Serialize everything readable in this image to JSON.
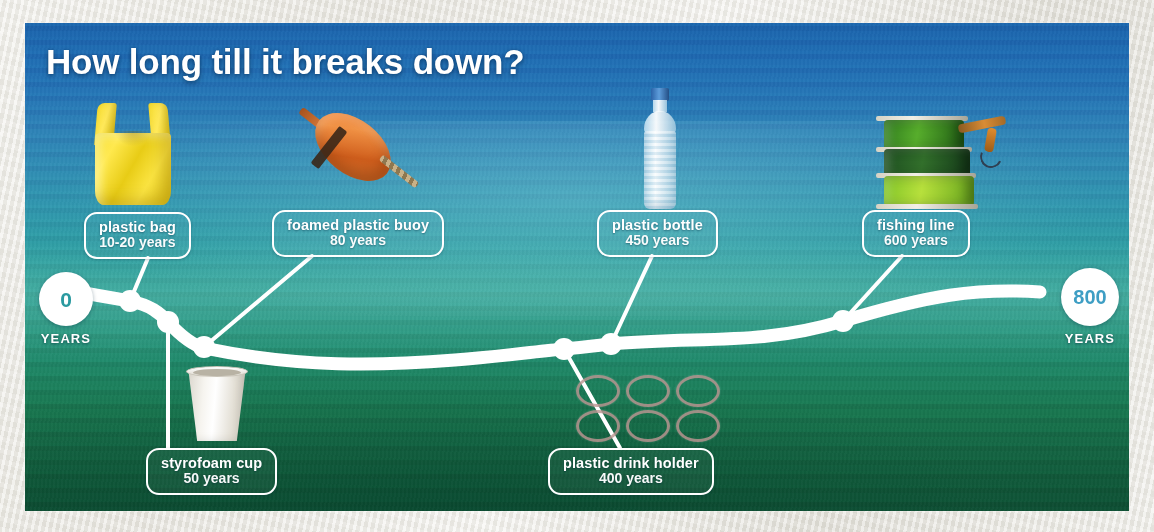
{
  "title": "How long till it breaks down?",
  "axis": {
    "start_value": "0",
    "start_unit": "YEARS",
    "end_value": "800",
    "end_unit": "YEARS"
  },
  "colors": {
    "line": "#ffffff",
    "pill_border": "#ffffff",
    "text": "#ffffff",
    "start_label": "#2b9aa0",
    "end_label": "#3e9ec4",
    "water_top": "#1b63ab",
    "water_mid": "#2e9ca2",
    "water_bottom": "#0d4e33",
    "paper": "#efeee9"
  },
  "items": [
    {
      "name": "plastic bag",
      "duration": "10-20 years",
      "years": 15,
      "node_x": 130,
      "node_y": 301,
      "icon": "plastic-bag-photo"
    },
    {
      "name": "styrofoam cup",
      "duration": "50 years",
      "years": 50,
      "node_x": 168,
      "node_y": 322,
      "icon": "styrofoam-cup-photo"
    },
    {
      "name": "foamed plastic buoy",
      "duration": "80 years",
      "years": 80,
      "node_x": 204,
      "node_y": 347,
      "icon": "foamed-plastic-buoy-photo"
    },
    {
      "name": "plastic drink holder",
      "duration": "400 years",
      "years": 400,
      "node_x": 564,
      "node_y": 349,
      "icon": "plastic-drink-holder-photo"
    },
    {
      "name": "plastic bottle",
      "duration": "450 years",
      "years": 450,
      "node_x": 611,
      "node_y": 344,
      "icon": "plastic-bottle-photo"
    },
    {
      "name": "fishing line",
      "duration": "600 years",
      "years": 600,
      "node_x": 843,
      "node_y": 321,
      "icon": "fishing-line-spools-photo"
    }
  ],
  "chart_data": {
    "type": "line",
    "title": "How long till it breaks down?",
    "xlabel": "YEARS",
    "ylabel": "",
    "xlim": [
      0,
      800
    ],
    "grid": false,
    "legend": "none",
    "annotations": [
      "plastic bag — 10-20 years",
      "styrofoam cup — 50 years",
      "foamed plastic buoy — 80 years",
      "plastic drink holder — 400 years",
      "plastic bottle — 450 years",
      "fishing line — 600 years"
    ],
    "categories": [
      "plastic bag",
      "styrofoam cup",
      "foamed plastic buoy",
      "plastic drink holder",
      "plastic bottle",
      "fishing line"
    ],
    "values": [
      15,
      50,
      80,
      400,
      450,
      600
    ],
    "tick_labels": [
      "0",
      "800"
    ]
  }
}
